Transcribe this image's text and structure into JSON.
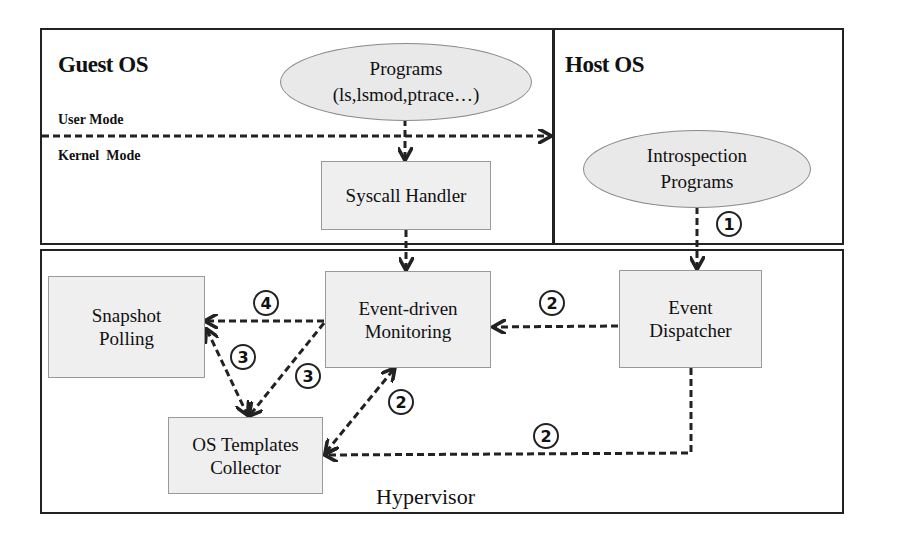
{
  "diagram": {
    "regions": {
      "guest_os": {
        "title": "Guest OS",
        "user_mode_label": "User Mode",
        "kernel_mode_label": "Kernel  Mode"
      },
      "host_os": {
        "title": "Host OS"
      },
      "hypervisor": {
        "title": "Hypervisor"
      }
    },
    "nodes": {
      "programs": {
        "line1": "Programs",
        "line2": "(ls,lsmod,ptrace…)",
        "shape": "ellipse"
      },
      "introspection_programs": {
        "line1": "Introspection",
        "line2": "Programs",
        "shape": "ellipse"
      },
      "syscall_handler": {
        "label": "Syscall Handler",
        "shape": "box"
      },
      "snapshot_polling": {
        "line1": "Snapshot",
        "line2": "Polling",
        "shape": "box"
      },
      "event_driven_monitoring": {
        "line1": "Event-driven",
        "line2": "Monitoring",
        "shape": "box"
      },
      "event_dispatcher": {
        "line1": "Event",
        "line2": "Dispatcher",
        "shape": "box"
      },
      "os_templates_collector": {
        "line1": "OS Templates",
        "line2": "Collector",
        "shape": "box"
      }
    },
    "steps": {
      "one": "1",
      "two_a": "2",
      "two_b": "2",
      "two_c": "2",
      "three_a": "3",
      "three_b": "3",
      "four": "4"
    },
    "edges": [
      {
        "from": "programs",
        "to": "syscall_handler",
        "style": "dashed"
      },
      {
        "from": "guest_os_mode_boundary",
        "to": "host_os",
        "style": "dashed"
      },
      {
        "from": "syscall_handler",
        "to": "event_driven_monitoring",
        "style": "dashed"
      },
      {
        "from": "introspection_programs",
        "to": "event_dispatcher",
        "style": "dashed",
        "step": "1"
      },
      {
        "from": "event_dispatcher",
        "to": "event_driven_monitoring",
        "style": "dashed",
        "step": "2"
      },
      {
        "from": "event_dispatcher",
        "to": "os_templates_collector",
        "style": "dashed",
        "step": "2"
      },
      {
        "from": "os_templates_collector",
        "to": "event_driven_monitoring",
        "style": "dashed",
        "bidirectional": true,
        "step": "2"
      },
      {
        "from": "event_driven_monitoring",
        "to": "os_templates_collector",
        "style": "dashed",
        "step": "3"
      },
      {
        "from": "os_templates_collector",
        "to": "snapshot_polling",
        "style": "dashed",
        "bidirectional": true,
        "step": "3"
      },
      {
        "from": "event_driven_monitoring",
        "to": "snapshot_polling",
        "style": "dashed",
        "step": "4"
      }
    ],
    "colors": {
      "box_fill": "#efefef",
      "ellipse_fill": "#e9e9e9",
      "line": "#222222",
      "background": "#ffffff"
    }
  }
}
